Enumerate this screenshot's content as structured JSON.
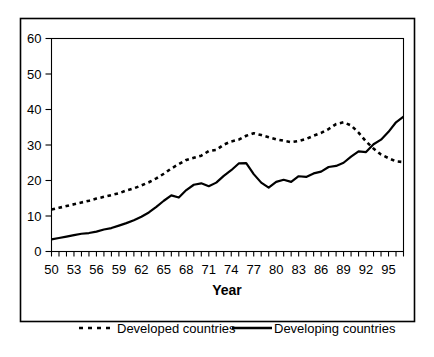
{
  "chart_data": {
    "type": "line",
    "title": "",
    "xlabel": "Year",
    "ylabel": "",
    "xlim": [
      1950,
      1997
    ],
    "ylim": [
      0,
      60
    ],
    "ytick_labels": [
      "0",
      "10",
      "20",
      "30",
      "40",
      "50",
      "60"
    ],
    "ytick_values": [
      0,
      10,
      20,
      30,
      40,
      50,
      60
    ],
    "xtick_labels": [
      "50",
      "53",
      "56",
      "59",
      "62",
      "65",
      "68",
      "71",
      "74",
      "77",
      "80",
      "83",
      "86",
      "89",
      "92",
      "95"
    ],
    "xtick_values": [
      1950,
      1953,
      1956,
      1959,
      1962,
      1965,
      1968,
      1971,
      1974,
      1977,
      1980,
      1983,
      1986,
      1989,
      1992,
      1995
    ],
    "minor_xticks_every": 1,
    "grid": false,
    "legend_position": "bottom",
    "x": [
      1950,
      1951,
      1952,
      1953,
      1954,
      1955,
      1956,
      1957,
      1958,
      1959,
      1960,
      1961,
      1962,
      1963,
      1964,
      1965,
      1966,
      1967,
      1968,
      1969,
      1970,
      1971,
      1972,
      1973,
      1974,
      1975,
      1976,
      1977,
      1978,
      1979,
      1980,
      1981,
      1982,
      1983,
      1984,
      1985,
      1986,
      1987,
      1988,
      1989,
      1990,
      1991,
      1992,
      1993,
      1994,
      1995,
      1996,
      1997
    ],
    "series": [
      {
        "name": "Developed countries",
        "style": "dashed",
        "color": "#000000",
        "values": [
          11.8,
          12.3,
          12.8,
          13.3,
          13.8,
          14.3,
          14.9,
          15.4,
          15.9,
          16.4,
          17.2,
          17.8,
          18.6,
          19.5,
          20.6,
          21.9,
          23.4,
          24.6,
          25.8,
          26.4,
          27.0,
          28.3,
          28.6,
          30.1,
          31.0,
          31.5,
          32.6,
          33.3,
          32.8,
          32.2,
          31.6,
          31.2,
          30.8,
          31.1,
          31.7,
          32.6,
          33.4,
          34.5,
          35.9,
          36.4,
          35.5,
          33.5,
          31.0,
          29.0,
          27.3,
          26.3,
          25.4,
          25.2
        ]
      },
      {
        "name": "Developing countries",
        "style": "solid",
        "color": "#000000",
        "values": [
          3.4,
          3.8,
          4.2,
          4.6,
          5.0,
          5.2,
          5.6,
          6.2,
          6.6,
          7.3,
          8.0,
          8.8,
          9.8,
          11.0,
          12.6,
          14.3,
          15.8,
          15.2,
          17.3,
          18.8,
          19.2,
          18.4,
          19.4,
          21.3,
          22.9,
          24.8,
          24.9,
          21.8,
          19.4,
          18.0,
          19.6,
          20.2,
          19.6,
          21.2,
          21.0,
          22.0,
          22.5,
          23.8,
          24.1,
          25.0,
          26.7,
          28.2,
          28.0,
          30.2,
          31.5,
          33.7,
          36.4,
          38.0
        ]
      }
    ],
    "extended_series_note": ""
  },
  "axes": {
    "x_axis_title": "Year",
    "y_axis_title": ""
  },
  "legend": {
    "entries": [
      {
        "label": "Developed countries",
        "marker": "dashed-line"
      },
      {
        "label": "Developing countries",
        "marker": "solid-line"
      }
    ]
  }
}
